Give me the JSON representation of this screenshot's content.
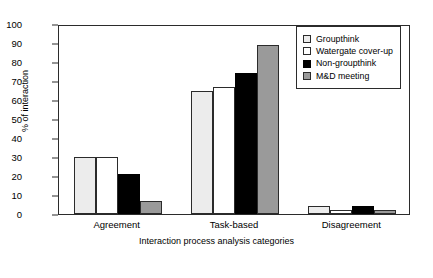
{
  "chart_data": {
    "type": "bar",
    "title": "",
    "xlabel": "Interaction process analysis categories",
    "ylabel": "% of interaction",
    "categories": [
      "Agreement",
      "Task-based",
      "Disagreement"
    ],
    "series": [
      {
        "name": "Groupthink",
        "color": "#ececec",
        "values": [
          30,
          65,
          4
        ]
      },
      {
        "name": "Watergate cover-up",
        "color": "#ffffff",
        "values": [
          30,
          67,
          2
        ]
      },
      {
        "name": "Non-groupthink",
        "color": "#000000",
        "values": [
          21,
          74,
          4
        ]
      },
      {
        "name": "M&D meeting",
        "color": "#9a9a9a",
        "values": [
          7,
          89,
          2
        ]
      }
    ],
    "ylim": [
      0,
      100
    ],
    "ytick_values": [
      0,
      10,
      20,
      30,
      40,
      50,
      60,
      70,
      80,
      90,
      100
    ],
    "ytick_labels": [
      "0",
      "10",
      "20",
      "30",
      "40",
      "50",
      "60",
      "70",
      "80",
      "90",
      "100"
    ],
    "grid": false,
    "legend_position": "top-right",
    "frame": true
  }
}
